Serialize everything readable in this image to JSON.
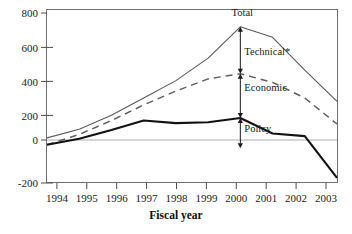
{
  "chart_data": {
    "type": "line",
    "title": "",
    "xlabel": "Fiscal year",
    "ylabel": "",
    "x": [
      1994,
      1995,
      1996,
      1997,
      1998,
      1999,
      2000,
      2001,
      2002,
      2003
    ],
    "categories": [
      "1994",
      "1995",
      "1996",
      "1997",
      "1998",
      "1999",
      "2000",
      "2001",
      "2002",
      "2003"
    ],
    "xlim": [
      1994,
      2003
    ],
    "ylim": [
      -200,
      800
    ],
    "yticks": [
      -200,
      0,
      200,
      400,
      600,
      800
    ],
    "ytick_labels": [
      "-200",
      "0",
      "200",
      "400",
      "600",
      "800"
    ],
    "grid": false,
    "legend": "none",
    "zero_line": 0,
    "series": [
      {
        "name": "Total",
        "style": "solid-thin-gray",
        "color": "#5a5a5a",
        "values": [
          60,
          110,
          190,
          290,
          390,
          520,
          700,
          640,
          450,
          270
        ]
      },
      {
        "name": "Economic + Policy",
        "style": "dashed-gray",
        "color": "#5f5f5f",
        "values": [
          20,
          80,
          160,
          250,
          330,
          400,
          430,
          380,
          290,
          140
        ]
      },
      {
        "name": "Policy",
        "style": "solid-thick-black",
        "color": "#121212",
        "values": [
          20,
          55,
          105,
          160,
          145,
          150,
          175,
          85,
          70,
          -170
        ]
      }
    ],
    "annotations": [
      {
        "label": "Total",
        "x": 2000,
        "y_text": 760,
        "band_top": 700,
        "band_bottom": 700,
        "kind": "series-label"
      },
      {
        "label": "Technical*",
        "x": 2000,
        "y_text": 540,
        "band_top": 700,
        "band_bottom": 430,
        "kind": "span-arrow"
      },
      {
        "label": "Economic",
        "x": 2000,
        "y_text": 330,
        "band_top": 430,
        "band_bottom": 175,
        "kind": "span-arrow"
      },
      {
        "label": "Policy",
        "x": 2000,
        "y_text": 95,
        "band_top": 175,
        "band_bottom": 0,
        "kind": "span-arrow"
      }
    ]
  },
  "axes": {
    "x_axis_title": "Fiscal year",
    "y_tick_800": "800",
    "y_tick_600": "600",
    "y_tick_400": "400",
    "y_tick_200": "200",
    "y_tick_0": "0",
    "y_tick_neg200": "-200",
    "x_tick_1994": "1994",
    "x_tick_1995": "1995",
    "x_tick_1996": "1996",
    "x_tick_1997": "1997",
    "x_tick_1998": "1998",
    "x_tick_1999": "1999",
    "x_tick_2000": "2000",
    "x_tick_2001": "2001",
    "x_tick_2002": "2002",
    "x_tick_2003": "2003"
  },
  "labels": {
    "total": "Total",
    "technical": "Technical*",
    "economic": "Economic",
    "policy": "Policy"
  },
  "colors": {
    "total_line": "#5a5a5a",
    "dashed_line": "#5f5f5f",
    "policy_line": "#121212",
    "frame": "#6f6f6f",
    "zero_line": "#b0b0b0",
    "text": "#1a1a1a",
    "background": "#ffffff"
  }
}
